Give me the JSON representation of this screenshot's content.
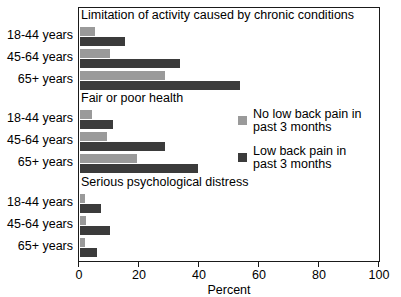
{
  "chart_data": {
    "type": "bar",
    "orientation": "horizontal",
    "title": "",
    "xlabel": "Percent",
    "ylabel": "",
    "xlim": [
      0,
      100
    ],
    "xticks": [
      0,
      20,
      40,
      60,
      80,
      100
    ],
    "xtick_labels": [
      "0",
      "20",
      "40",
      "60",
      "80",
      "100"
    ],
    "grid": false,
    "legend_position": "center-right",
    "categories": [
      "18-44 years",
      "45-64 years",
      "65+ years"
    ],
    "series": [
      {
        "name": "No low back pain in\npast 3 months",
        "color": "#9a9a9a"
      },
      {
        "name": "Low back pain in\npast 3 months",
        "color": "#3b3b3b"
      }
    ],
    "panels": [
      {
        "title": "Limitation of activity caused by chronic conditions",
        "categories": [
          "18-44 years",
          "45-64 years",
          "65+ years"
        ],
        "series": [
          {
            "name": "No low back pain in past 3 months",
            "values": [
              5,
              10,
              28
            ]
          },
          {
            "name": "Low back pain in past 3 months",
            "values": [
              15,
              33,
              53
            ]
          }
        ]
      },
      {
        "title": "Fair or poor health",
        "categories": [
          "18-44 years",
          "45-64 years",
          "65+ years"
        ],
        "series": [
          {
            "name": "No low back pain in past 3 months",
            "values": [
              4,
              9,
              19
            ]
          },
          {
            "name": "Low back pain in past 3 months",
            "values": [
              11,
              28,
              39
            ]
          }
        ]
      },
      {
        "title": "Serious psychological distress",
        "categories": [
          "18-44 years",
          "45-64 years",
          "65+ years"
        ],
        "series": [
          {
            "name": "No low back pain in past 3 months",
            "values": [
              1.5,
              2,
              1.5
            ]
          },
          {
            "name": "Low back pain in past 3 months",
            "values": [
              7,
              10,
              5.5
            ]
          }
        ]
      }
    ]
  },
  "axis": {
    "x_title": "Percent",
    "ticks": [
      "0",
      "20",
      "40",
      "60",
      "80",
      "100"
    ]
  },
  "panel_titles": {
    "p0": "Limitation of activity caused by chronic conditions",
    "p1": "Fair or poor health",
    "p2": "Serious psychological distress"
  },
  "category_labels": {
    "a0": "18-44 years",
    "a1": "45-64 years",
    "a2": "65+ years",
    "b0": "18-44 years",
    "b1": "45-64 years",
    "b2": "65+ years",
    "c0": "18-44 years",
    "c1": "45-64 years",
    "c2": "65+ years"
  },
  "legend": {
    "items": [
      {
        "label": "No low back pain in\npast 3 months",
        "color": "#9a9a9a"
      },
      {
        "label": "Low back pain in\npast 3 months",
        "color": "#3b3b3b"
      }
    ]
  },
  "colors": {
    "light": "#9a9a9a",
    "dark": "#3b3b3b",
    "frame": "#1a1a1a",
    "background": "#ffffff"
  }
}
